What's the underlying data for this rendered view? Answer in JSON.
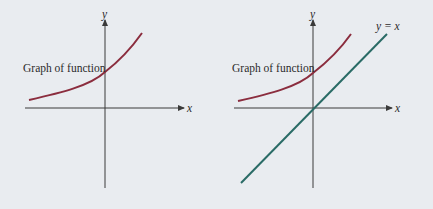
{
  "background": "#e9ecf0",
  "colors": {
    "axis": "#3a3a3a",
    "curve": "#8b2d3e",
    "identity_line": "#2a6b66",
    "text": "#2b2b2b"
  },
  "panels": [
    {
      "id": "left",
      "curve_label": "Graph of function",
      "x_axis_label": "x",
      "y_axis_label": "y"
    },
    {
      "id": "right",
      "curve_label": "Graph of function",
      "x_axis_label": "x",
      "y_axis_label": "y",
      "line_label": "y = x"
    }
  ]
}
